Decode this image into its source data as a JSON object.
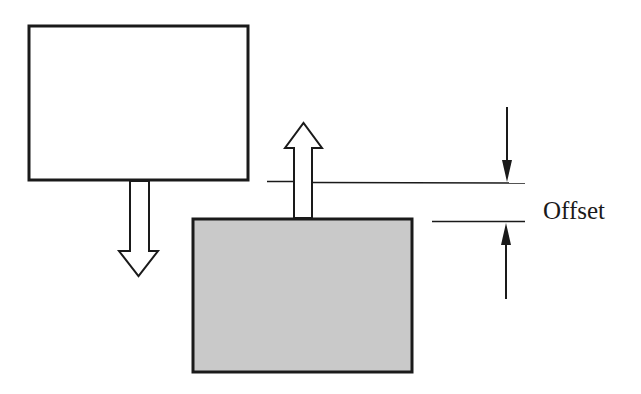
{
  "diagram": {
    "type": "mechanical-offset-illustration",
    "colors": {
      "stroke": "#1a1a1a",
      "background": "#ffffff",
      "lower_block_fill": "#c9c9c9",
      "upper_block_fill": "#ffffff"
    },
    "upper_block": {
      "fill": "white",
      "motion": "down"
    },
    "lower_block": {
      "fill": "gray",
      "motion": "up"
    },
    "dimension": {
      "label": "Offset"
    }
  }
}
